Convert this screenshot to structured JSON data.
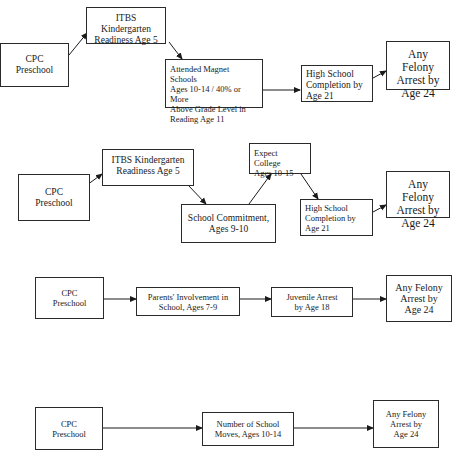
{
  "diagrams": [
    {
      "id": "model-1",
      "nodes": {
        "cpc": "CPC\nPreschool",
        "itbs": "ITBS Kindergarten\nReadiness Age 5",
        "magnet": "Attended Magnet Schools\nAges 10-14 / 40% or More\nAbove Grade Level in\nReading Age 11",
        "hs": "High School\nCompletion by\nAge 21",
        "felony": "Any Felony\nArrest by\nAge 24"
      },
      "edges": [
        [
          "cpc",
          "itbs"
        ],
        [
          "itbs",
          "magnet"
        ],
        [
          "magnet",
          "hs"
        ],
        [
          "hs",
          "felony"
        ]
      ]
    },
    {
      "id": "model-2",
      "nodes": {
        "cpc": "CPC\nPreschool",
        "itbs": "ITBS Kindergarten\nReadiness Age 5",
        "commitment": "School Commitment,\nAges 9-10",
        "college": "Expect College\nAges 10-15",
        "hs": "High School\nCompletion by\nAge 21",
        "felony": "Any Felony\nArrest by\nAge 24"
      },
      "edges": [
        [
          "cpc",
          "itbs"
        ],
        [
          "itbs",
          "commitment"
        ],
        [
          "commitment",
          "college"
        ],
        [
          "college",
          "hs"
        ],
        [
          "hs",
          "felony"
        ]
      ]
    },
    {
      "id": "model-3",
      "nodes": {
        "cpc": "CPC\nPreschool",
        "parents": "Parents' Involvement in\nSchool, Ages 7-9",
        "juvenile": "Juvenile Arrest\nby Age 18",
        "felony": "Any Felony\nArrest by\nAge 24"
      },
      "edges": [
        [
          "cpc",
          "parents"
        ],
        [
          "parents",
          "juvenile"
        ],
        [
          "juvenile",
          "felony"
        ]
      ]
    },
    {
      "id": "model-4",
      "nodes": {
        "cpc": "CPC\nPreschool",
        "moves": "Number of School\nMoves, Ages 10-14",
        "felony": "Any Felony\nArrest by\nAge 24"
      },
      "edges": [
        [
          "cpc",
          "moves"
        ],
        [
          "moves",
          "felony"
        ]
      ]
    }
  ],
  "caption": "",
  "colors": {
    "stroke": "#2a2a2a",
    "background": "#ffffff",
    "text": "#1a1a1a"
  }
}
